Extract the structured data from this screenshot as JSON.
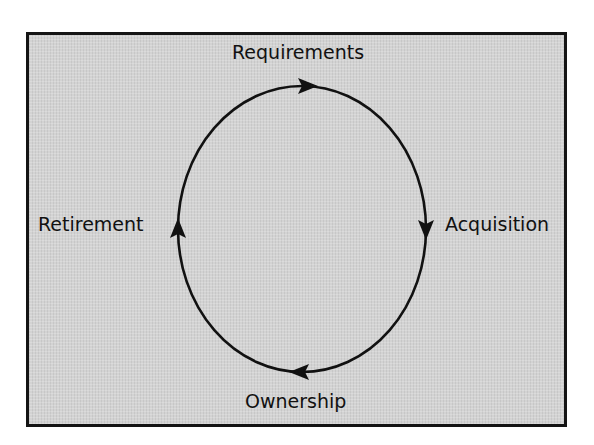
{
  "diagram": {
    "type": "cycle",
    "direction": "clockwise",
    "background_color": "#d3d3d3",
    "border_color": "#141414",
    "stroke_color": "#111111",
    "nodes": [
      {
        "id": "requirements",
        "label": "Requirements",
        "position": "top"
      },
      {
        "id": "acquisition",
        "label": "Acquisition",
        "position": "right"
      },
      {
        "id": "ownership",
        "label": "Ownership",
        "position": "bottom"
      },
      {
        "id": "retirement",
        "label": "Retirement",
        "position": "left"
      }
    ],
    "edges": [
      {
        "from": "requirements",
        "to": "acquisition"
      },
      {
        "from": "acquisition",
        "to": "ownership"
      },
      {
        "from": "ownership",
        "to": "retirement"
      },
      {
        "from": "retirement",
        "to": "requirements"
      }
    ]
  }
}
